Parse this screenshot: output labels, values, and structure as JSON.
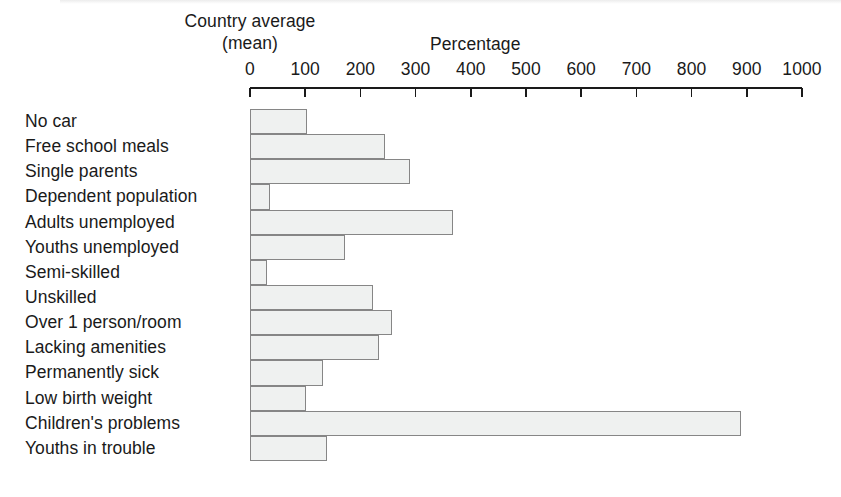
{
  "figure": {
    "country_average_line1": "Country average",
    "country_average_line2": "(mean)",
    "percentage_title": "Percentage"
  },
  "chart_data": {
    "type": "bar",
    "orientation": "horizontal",
    "title": "Percentage",
    "subtitle": "Country average (mean)",
    "xlabel": "Percentage",
    "ylabel": "",
    "xlim": [
      0,
      1000
    ],
    "xticks": [
      0,
      100,
      200,
      300,
      400,
      500,
      600,
      700,
      800,
      900,
      1000
    ],
    "xtick_labels": [
      "0",
      "100",
      "200",
      "300",
      "400",
      "500",
      "600",
      "700",
      "800",
      "900",
      "1000"
    ],
    "grid": false,
    "legend": null,
    "bar_fill_color": "#eff1f0",
    "bar_edge_color": "#868686",
    "axis_color": "#1a1a1a",
    "categories": [
      "No car",
      "Free school meals",
      "Single parents",
      "Dependent population",
      "Adults unemployed",
      "Youths unemployed",
      "Semi-skilled",
      "Unskilled",
      "Over 1 person/room",
      "Lacking amenities",
      "Permanently sick",
      "Low birth weight",
      "Children's problems",
      "Youths in trouble"
    ],
    "values": [
      104,
      245,
      290,
      36,
      367,
      172,
      30,
      222,
      258,
      234,
      133,
      101,
      890,
      139
    ]
  }
}
